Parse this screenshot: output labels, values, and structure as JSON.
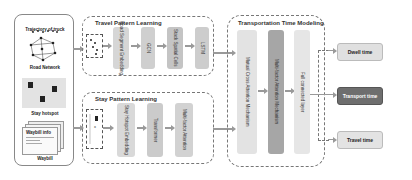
{
  "inputs": {
    "trajectory_label": "Trajectory of truck",
    "road_network_label": "Road Network",
    "stay_hotspot_label": "Stay hotspot",
    "waybill_label": "Waybill",
    "waybill_card_title": "Waybill info"
  },
  "travel_pattern": {
    "title": "Travel Pattern Learning",
    "blocks": [
      "Road Segment Embedding",
      "GCN",
      "Stack Spatial Cells",
      "LSTM"
    ]
  },
  "stay_pattern": {
    "title": "Stay Pattern Learning",
    "blocks": [
      "Stay Hotspot Embedding",
      "Transformer",
      "Multi-factor Attention"
    ]
  },
  "transport_model": {
    "title": "Transportation Time Modeling",
    "blocks": [
      "Mutual Cross Attention Mechanism",
      "Multi-factor Attention Mechanism",
      "Full connected layer"
    ]
  },
  "outputs": {
    "dwell": "Dwell time",
    "transport": "Transport time",
    "travel": "Travel time"
  },
  "colors": {
    "block_light": "#d9d9d9",
    "block_mid": "#bdbdbd",
    "block_dark": "#8c8c8c",
    "output_dark": "#6e6e6e"
  }
}
